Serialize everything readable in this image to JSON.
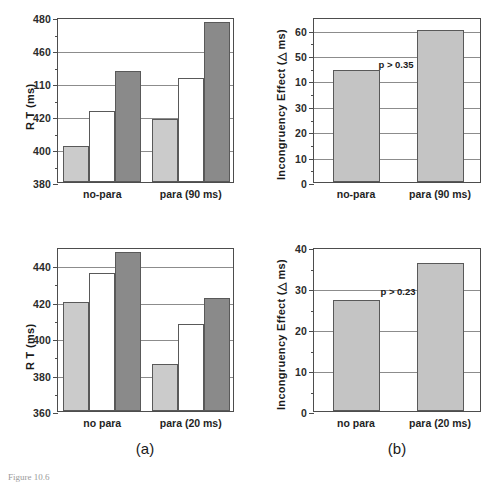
{
  "figure": {
    "panel_a_label": "(a)",
    "panel_b_label": "(b)",
    "caption_fragment": "Figure 10.6"
  },
  "chart_data": [
    {
      "id": "top-left",
      "type": "bar",
      "title": "",
      "xlabel": "",
      "ylabel": "R T (ms)",
      "ylim": [
        380,
        480
      ],
      "yticks": [
        380,
        400,
        420,
        440,
        460,
        480
      ],
      "ytick_labels": [
        "380",
        "400",
        "420",
        "110",
        "460",
        "480"
      ],
      "grid": true,
      "legend": "none",
      "categories": [
        "no-para",
        "para (90 ms)"
      ],
      "series": [
        {
          "name": "light",
          "color": "#cbcbcb",
          "values": [
            402,
            418
          ]
        },
        {
          "name": "white",
          "color": "#ffffff",
          "values": [
            423,
            443
          ]
        },
        {
          "name": "dark",
          "color": "#8a8a8a",
          "values": [
            447,
            477
          ]
        }
      ]
    },
    {
      "id": "top-right",
      "type": "bar",
      "title": "",
      "xlabel": "",
      "ylabel": "Incongruency Effect (△ ms)",
      "ylim": [
        0,
        65
      ],
      "yticks": [
        0,
        10,
        20,
        30,
        40,
        50,
        60
      ],
      "ytick_labels": [
        "0",
        "10",
        "20",
        "30",
        "10",
        "50",
        "60"
      ],
      "grid": true,
      "legend": "none",
      "categories": [
        "no-para",
        "para (90 ms)"
      ],
      "values": [
        44,
        60
      ],
      "bar_color": "#c4c4c4",
      "annotation": "p > 0.35"
    },
    {
      "id": "bottom-left",
      "type": "bar",
      "title": "",
      "xlabel": "",
      "ylabel": "R T (ms)",
      "ylim": [
        360,
        450
      ],
      "yticks": [
        360,
        380,
        400,
        420,
        440
      ],
      "ytick_labels": [
        "360",
        "380",
        "400",
        "420",
        "440"
      ],
      "grid": true,
      "legend": "none",
      "categories": [
        "no para",
        "para (20 ms)"
      ],
      "series": [
        {
          "name": "light",
          "color": "#cbcbcb",
          "values": [
            420,
            386
          ]
        },
        {
          "name": "white",
          "color": "#ffffff",
          "values": [
            436,
            408
          ]
        },
        {
          "name": "dark",
          "color": "#8a8a8a",
          "values": [
            447,
            422
          ]
        }
      ]
    },
    {
      "id": "bottom-right",
      "type": "bar",
      "title": "",
      "xlabel": "",
      "ylabel": "Incongruency Effect (△ ms)",
      "ylim": [
        0,
        40
      ],
      "yticks": [
        0,
        10,
        20,
        30,
        40
      ],
      "ytick_labels": [
        "0",
        "10",
        "20",
        "30",
        "40"
      ],
      "grid": true,
      "legend": "none",
      "categories": [
        "no para",
        "para (20 ms)"
      ],
      "values": [
        27,
        36
      ],
      "bar_color": "#c4c4c4",
      "annotation": "p > 0.23"
    }
  ]
}
